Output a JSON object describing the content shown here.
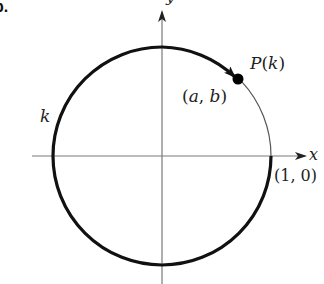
{
  "figure": {
    "part_label": "b.",
    "axis_x_label": "x",
    "axis_y_label": "y",
    "arc_length_label": "k",
    "point_label": "P(k)",
    "point_coords_label": "(a, b)",
    "start_point_label": "(1, 0)"
  },
  "geometry": {
    "center": [
      162,
      156
    ],
    "radius": 109,
    "point_P_angle_deg": 43,
    "arc_direction": "counterclockwise from (1,0) through bottom, left, top to P",
    "colors": {
      "axis": "#7a7a7a",
      "thick_arc": "#111111",
      "thin_arc": "#555555",
      "point": "#000000"
    }
  }
}
